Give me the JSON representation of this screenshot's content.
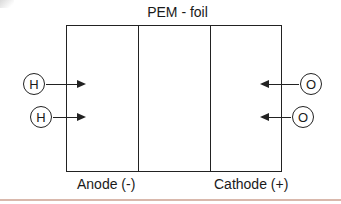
{
  "diagram": {
    "title": "PEM - foil",
    "electrodes": {
      "anode_label": "Anode (-)",
      "cathode_label": "Cathode (+)"
    },
    "inputs_left": [
      {
        "symbol": "H",
        "direction": "right"
      },
      {
        "symbol": "H",
        "direction": "right"
      }
    ],
    "inputs_right": [
      {
        "symbol": "O",
        "direction": "left"
      },
      {
        "symbol": "O",
        "direction": "left"
      }
    ],
    "colors": {
      "stroke": "#222222",
      "bottom_rule": "#d9b8ac"
    }
  }
}
